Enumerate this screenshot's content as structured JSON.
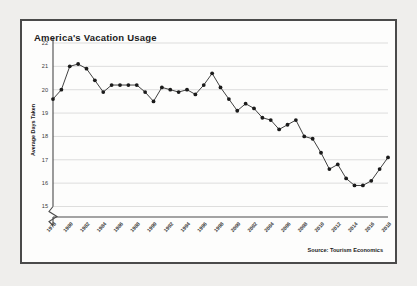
{
  "figure": {
    "title": "America's Vacation Usage",
    "source_note": "Source: Tourism Economics",
    "border_color": "#4a4a4a",
    "background_color": "#fdfdfc",
    "page_background_color": "#efeeec"
  },
  "chart_data": {
    "type": "line",
    "title": "America's Vacation Usage",
    "xlabel": "",
    "ylabel": "Average Days Taken",
    "ylim": [
      14.55,
      22.0
    ],
    "yticks": [
      15,
      16,
      17,
      18,
      19,
      20,
      21,
      22
    ],
    "ytick_labels": [
      "15",
      "16",
      "17",
      "18",
      "19",
      "20",
      "21",
      "22"
    ],
    "grid": true,
    "y_axis_break": true,
    "legend": "none",
    "marker": "circle",
    "line_color": "#2b2b2b",
    "marker_color": "#1b1b1b",
    "grid_color": "#cfcfcf",
    "x": [
      1978,
      1979,
      1980,
      1981,
      1982,
      1983,
      1984,
      1985,
      1986,
      1987,
      1988,
      1989,
      1990,
      1991,
      1992,
      1993,
      1994,
      1995,
      1996,
      1997,
      1998,
      1999,
      2000,
      2001,
      2002,
      2003,
      2004,
      2005,
      2006,
      2007,
      2008,
      2009,
      2010,
      2011,
      2012,
      2013,
      2014,
      2015,
      2016,
      2017,
      2018
    ],
    "xtick_labels": [
      "1978",
      "1980",
      "1982",
      "1984",
      "1986",
      "1988",
      "1990",
      "1992",
      "1994",
      "1996",
      "1998",
      "2000",
      "2002",
      "2004",
      "2006",
      "2008",
      "2010",
      "2012",
      "2014",
      "2016",
      "2018"
    ],
    "xtick_step": 2,
    "values": [
      19.6,
      20.0,
      21.0,
      21.1,
      20.9,
      20.4,
      19.9,
      20.2,
      20.2,
      20.2,
      20.2,
      19.9,
      19.5,
      20.1,
      20.0,
      19.9,
      20.0,
      19.8,
      20.2,
      20.7,
      20.1,
      19.6,
      19.1,
      19.4,
      19.2,
      18.8,
      18.7,
      18.3,
      18.5,
      18.7,
      18.0,
      17.9,
      17.3,
      16.6,
      16.8,
      16.2,
      15.9,
      15.9,
      16.1,
      16.6,
      17.1
    ],
    "last_value": 17.2,
    "peak_value": 21.1,
    "peak_year": 1981,
    "min_value": 15.9,
    "min_year": 2014
  }
}
